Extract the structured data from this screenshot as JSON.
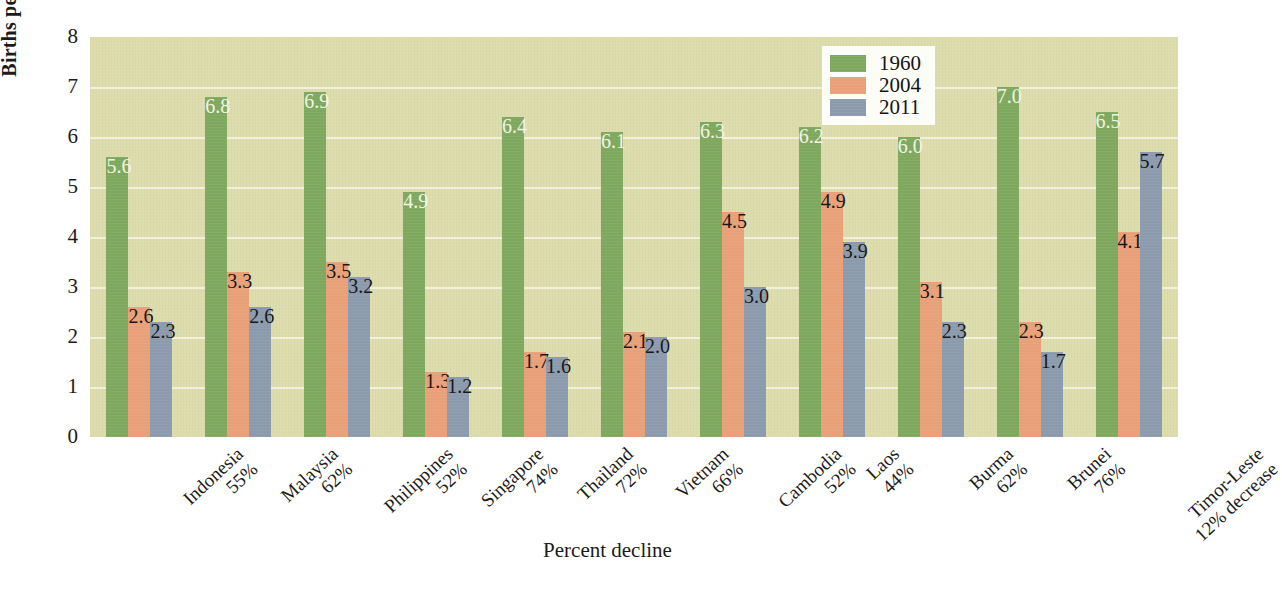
{
  "chart_data": {
    "type": "bar",
    "title": "",
    "xlabel": "Percent decline",
    "ylabel": "Births per woman",
    "ylim": [
      0,
      8
    ],
    "yticks": [
      0,
      1,
      2,
      3,
      4,
      5,
      6,
      7,
      8
    ],
    "grid": true,
    "legend_position": "top-right",
    "categories": [
      "Indonesia",
      "Malaysia",
      "Philippines",
      "Singapore",
      "Thailand",
      "Vietnam",
      "Cambodia",
      "Laos",
      "Burma",
      "Brunei",
      "Timor-Leste"
    ],
    "category_sublabels": [
      "55%",
      "62%",
      "52%",
      "74%",
      "72%",
      "66%",
      "52%",
      "44%",
      "62%",
      "76%",
      "12% decrease"
    ],
    "series": [
      {
        "name": "1960",
        "color": "#7fa85f",
        "values": [
          5.6,
          6.8,
          6.9,
          4.9,
          6.4,
          6.1,
          6.3,
          6.2,
          6.0,
          7.0,
          6.5
        ],
        "labels": [
          "5.6",
          "6.8",
          "6.9",
          "4.9",
          "6.4",
          "6.1",
          "6.3",
          "6.2",
          "6.0",
          "7.0",
          "6.5"
        ]
      },
      {
        "name": "2004",
        "color": "#e8a079",
        "values": [
          2.6,
          3.3,
          3.5,
          1.3,
          1.7,
          2.1,
          4.5,
          4.9,
          3.1,
          2.3,
          4.1
        ],
        "labels": [
          "2.6",
          "3.3",
          "3.5",
          "1.3",
          "1.7",
          "2.1",
          "4.5",
          "4.9",
          "3.1",
          "2.3",
          "4.1"
        ]
      },
      {
        "name": "2011",
        "color": "#8c9aad",
        "values": [
          2.3,
          2.6,
          3.2,
          1.2,
          1.6,
          2.0,
          3.0,
          3.9,
          2.3,
          1.7,
          5.7
        ],
        "labels": [
          "2.3",
          "2.6",
          "3.2",
          "1.2",
          "1.6",
          "2.0",
          "3.0",
          "3.9",
          "2.3",
          "1.7",
          "5.7"
        ]
      }
    ]
  },
  "legend": {
    "items": [
      {
        "label": "1960",
        "color": "#7fa85f"
      },
      {
        "label": "2004",
        "color": "#e8a079"
      },
      {
        "label": "2011",
        "color": "#8c9aad"
      }
    ]
  },
  "axes": {
    "y_title": "Births per woman",
    "x_title": "Percent decline"
  },
  "colors": {
    "plot_background": "#dcdcad",
    "gridline": "#f7f6e2",
    "series_1960": "#7fa85f",
    "series_2004": "#e8a079",
    "series_2011": "#8c9aad",
    "text": "#1b1b1b"
  }
}
